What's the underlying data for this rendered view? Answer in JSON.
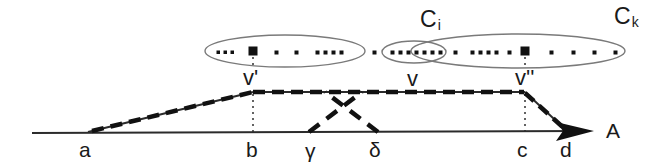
{
  "figure": {
    "title": "",
    "colors": {
      "ink": "#1a1a1a",
      "ellipse_stroke": "#6e6e6e",
      "dot_fill": "#111111",
      "background": "#ffffff"
    }
  },
  "clusters": {
    "left": {
      "label": "C",
      "subscript": "",
      "dot_count": 10,
      "has_big_square": true
    },
    "middle": {
      "label": "C",
      "subscript": "i"
    },
    "right": {
      "label": "C",
      "subscript": "k",
      "dot_count": 16,
      "has_big_square": true
    }
  },
  "vertex_labels": {
    "v_prime": "v'",
    "v": "v",
    "v_double_prime": "v''"
  },
  "axis_labels": {
    "a": "a",
    "b": "b",
    "gamma": "γ",
    "delta": "δ",
    "c": "c",
    "d": "d",
    "axis_name": "A"
  },
  "point_series": {
    "left_ellipse_dots": [
      {
        "x": 218,
        "y": 52,
        "size": 3
      },
      {
        "x": 225,
        "y": 52,
        "size": 3
      },
      {
        "x": 232,
        "y": 52,
        "size": 3
      },
      {
        "x": 253,
        "y": 51,
        "size": 9
      },
      {
        "x": 276,
        "y": 52,
        "size": 4
      },
      {
        "x": 296,
        "y": 52,
        "size": 4
      },
      {
        "x": 317,
        "y": 52,
        "size": 4
      },
      {
        "x": 325,
        "y": 52,
        "size": 4
      },
      {
        "x": 333,
        "y": 52,
        "size": 4
      },
      {
        "x": 341,
        "y": 52,
        "size": 4
      }
    ],
    "middle_dots": [
      {
        "x": 374,
        "y": 52,
        "size": 4
      },
      {
        "x": 392,
        "y": 52,
        "size": 4
      },
      {
        "x": 400,
        "y": 52,
        "size": 4
      },
      {
        "x": 408,
        "y": 52,
        "size": 4
      },
      {
        "x": 416,
        "y": 52,
        "size": 4
      },
      {
        "x": 424,
        "y": 52,
        "size": 4
      },
      {
        "x": 432,
        "y": 52,
        "size": 4
      },
      {
        "x": 440,
        "y": 52,
        "size": 4
      },
      {
        "x": 455,
        "y": 52,
        "size": 4
      },
      {
        "x": 472,
        "y": 52,
        "size": 4
      },
      {
        "x": 480,
        "y": 52,
        "size": 4
      },
      {
        "x": 488,
        "y": 52,
        "size": 4
      },
      {
        "x": 496,
        "y": 52,
        "size": 4
      },
      {
        "x": 509,
        "y": 52,
        "size": 4
      },
      {
        "x": 525,
        "y": 51,
        "size": 9
      },
      {
        "x": 551,
        "y": 52,
        "size": 4
      },
      {
        "x": 573,
        "y": 52,
        "size": 4
      },
      {
        "x": 594,
        "y": 52,
        "size": 4
      },
      {
        "x": 615,
        "y": 52,
        "size": 4
      }
    ]
  },
  "geometry": {
    "baseline_y": 133,
    "plateau_y": 92,
    "a_x": 88,
    "b_x": 253,
    "gamma_x": 312,
    "delta_x": 375,
    "c_x": 525,
    "d_x": 567
  }
}
